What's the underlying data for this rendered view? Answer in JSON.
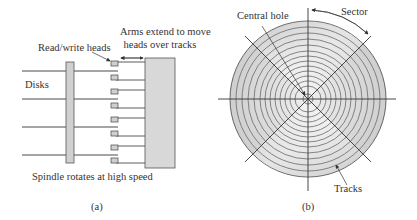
{
  "figure_a": {
    "caption": "(a)",
    "labels": {
      "read_write_heads": "Read/write heads",
      "arms_line1": "Arms extend to move",
      "arms_line2": "heads over tracks",
      "disks": "Disks",
      "spindle": "Spindle rotates at high speed"
    },
    "disk_count": 4,
    "head_count": 8
  },
  "figure_b": {
    "caption": "(b)",
    "labels": {
      "central_hole": "Central hole",
      "sector": "Sector",
      "tracks": "Tracks"
    },
    "track_count": 12
  },
  "colors": {
    "line": "#3a3a3a",
    "fill_gray": "#d4d4d4",
    "disk_light": "#f2f2f2",
    "disk_dark": "#c8c8c8"
  }
}
